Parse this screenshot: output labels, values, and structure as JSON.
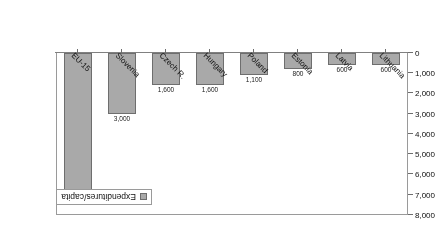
{
  "chart_data": {
    "type": "bar",
    "title": "",
    "subtitle": "",
    "xlabel": "",
    "ylabel": "",
    "orientation": "vertical-inverted",
    "rotated_180": true,
    "categories": [
      "Lithuania",
      "Latvia",
      "Estonia",
      "Poland",
      "Hungary",
      "Czech R.",
      "Slovenia",
      "EU-15"
    ],
    "values": [
      600,
      600,
      800,
      1100,
      1600,
      1600,
      3000,
      7000
    ],
    "value_labels": [
      "600",
      "600",
      "800",
      "1,100",
      "1,600",
      "1,600",
      "3,000",
      "7,000"
    ],
    "series": [
      {
        "name": "Expenditures/capita",
        "values": [
          600,
          600,
          800,
          1100,
          1600,
          1600,
          3000,
          7000
        ]
      }
    ],
    "ylim": [
      0,
      8000
    ],
    "ytick_values": [
      0,
      1000,
      2000,
      3000,
      4000,
      5000,
      6000,
      7000,
      8000
    ],
    "ytick_labels": [
      "0",
      "1,000",
      "2,000",
      "3,000",
      "4,000",
      "5,000",
      "6,000",
      "7,000",
      "8,000"
    ],
    "grid": false,
    "legend": {
      "position": "bottom-left",
      "entries": [
        "Expenditures/capita"
      ]
    },
    "colors": {
      "bar_fill": "#a9a9a9",
      "bar_border": "#6e6e6e",
      "axis": "#6e6e6e",
      "frame": "#9a9a9a",
      "text": "#111111",
      "background": "#ffffff"
    }
  }
}
